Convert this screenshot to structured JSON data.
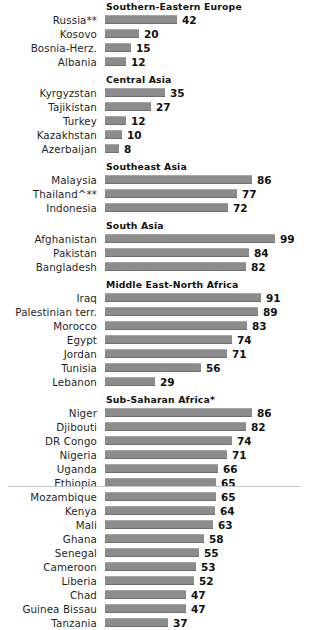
{
  "chart_data": {
    "type": "bar",
    "title": "",
    "xlabel": "",
    "ylabel": "",
    "orientation": "horizontal",
    "xlim": [
      0,
      99
    ],
    "grid": false,
    "legend": "none",
    "value_suffix": "",
    "groups": [
      {
        "header": "Southern-Eastern  Europe",
        "categories": [
          "Russia**",
          "Kosovo",
          "Bosnia-Herz.",
          "Albania"
        ],
        "values": [
          42,
          20,
          15,
          12
        ]
      },
      {
        "header": "Central Asia",
        "categories": [
          "Kyrgyzstan",
          "Tajikistan",
          "Turkey",
          "Kazakhstan",
          "Azerbaijan"
        ],
        "values": [
          35,
          27,
          12,
          10,
          8
        ]
      },
      {
        "header": "Southeast  Asia",
        "categories": [
          "Malaysia",
          "Thailand^**",
          "Indonesia"
        ],
        "values": [
          86,
          77,
          72
        ]
      },
      {
        "header": "South Asia",
        "categories": [
          "Afghanistan",
          "Pakistan",
          "Bangladesh"
        ],
        "values": [
          99,
          84,
          82
        ]
      },
      {
        "header": "Middle East-North  Africa",
        "categories": [
          "Iraq",
          "Palestinian terr.",
          "Morocco",
          "Egypt",
          "Jordan",
          "Tunisia",
          "Lebanon"
        ],
        "values": [
          91,
          89,
          83,
          74,
          71,
          56,
          29
        ]
      },
      {
        "header": "Sub-Saharan  Africa*",
        "categories": [
          "Niger",
          "Djibouti",
          "DR Congo",
          "Nigeria",
          "Uganda",
          "Ethiopia",
          "Mozambique",
          "Kenya",
          "Mali",
          "Ghana",
          "Senegal",
          "Cameroon",
          "Liberia",
          "Chad",
          "Guinea Bissau",
          "Tanzania"
        ],
        "values": [
          86,
          82,
          74,
          71,
          66,
          65,
          65,
          64,
          63,
          58,
          55,
          53,
          52,
          47,
          47,
          37
        ]
      }
    ]
  },
  "style": {
    "bar_color": "#8c8c8c",
    "text_color": "#1a1a1a",
    "background": "#ffffff"
  }
}
